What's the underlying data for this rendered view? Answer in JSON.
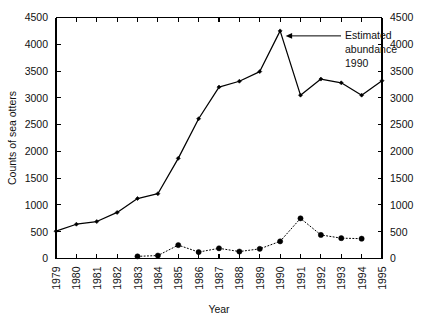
{
  "chart_data": {
    "type": "line",
    "title": "",
    "xlabel": "Year",
    "ylabel": "Counts of sea otters",
    "ylabel_right": "",
    "x": [
      1979,
      1980,
      1981,
      1982,
      1983,
      1984,
      1985,
      1986,
      1987,
      1988,
      1989,
      1990,
      1991,
      1992,
      1993,
      1994,
      1995
    ],
    "categories": [
      "1979",
      "1980",
      "1981",
      "1982",
      "1983",
      "1984",
      "1985",
      "1986",
      "1987",
      "1988",
      "1989",
      "1990",
      "1991",
      "1992",
      "1993",
      "1994",
      "1995"
    ],
    "ylim": [
      0,
      4500
    ],
    "yticks": [
      0,
      500,
      1000,
      1500,
      2000,
      2500,
      3000,
      3500,
      4000,
      4500
    ],
    "ytick_labels": [
      "0",
      "500",
      "1000",
      "1500",
      "2000",
      "2500",
      "3000",
      "3500",
      "4000",
      "4500"
    ],
    "ytick_labels_right": [
      "0",
      "500",
      "1000",
      "1500",
      "2000",
      "2500",
      "3000",
      "3500",
      "4000",
      "4500"
    ],
    "grid": false,
    "legend": false,
    "xtick_rotation": 90,
    "series": [
      {
        "name": "Counts of sea otters",
        "style": "solid",
        "marker": "filled-diamond",
        "color": "#000000",
        "x": [
          1979,
          1980,
          1981,
          1982,
          1983,
          1984,
          1985,
          1986,
          1987,
          1988,
          1989,
          1990,
          1991,
          1992,
          1993,
          1994,
          1995
        ],
        "values": [
          510,
          640,
          690,
          860,
          1120,
          1210,
          1870,
          2610,
          3200,
          3310,
          3490,
          4250,
          3050,
          3350,
          3280,
          3050,
          3320
        ]
      },
      {
        "name": "Estimated abundance",
        "style": "dotted",
        "marker": "filled-circle",
        "color": "#000000",
        "x": [
          1983,
          1984,
          1985,
          1986,
          1987,
          1988,
          1989,
          1990,
          1991,
          1992,
          1993,
          1994
        ],
        "values": [
          40,
          55,
          250,
          120,
          190,
          130,
          180,
          320,
          750,
          440,
          380,
          370
        ]
      }
    ],
    "annotations": [
      {
        "text_lines": [
          "Estimated",
          "abundance",
          "1990"
        ],
        "target_x": 1990,
        "target_y": 4250,
        "arrow": "left"
      }
    ]
  }
}
